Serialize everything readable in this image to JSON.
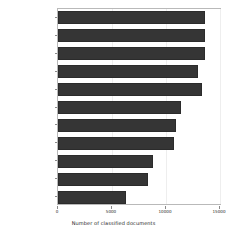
{
  "chart_data": {
    "type": "bar",
    "orientation": "horizontal",
    "title": "",
    "xlabel": "Number of classified documents",
    "ylabel": "",
    "categories": [
      "general words",
      "syringe",
      "marijuana",
      "preparation slang",
      "injections",
      "cocaine",
      "sex serum",
      "pills",
      "methamphetamine",
      "needle",
      "heroin"
    ],
    "values": [
      13600,
      13600,
      13600,
      12950,
      13300,
      11400,
      10900,
      10700,
      8800,
      8300,
      6300
    ],
    "xlim": [
      0,
      15000
    ],
    "xticks": [
      0,
      5000,
      10000,
      15000
    ],
    "xtick_labels": [
      "0",
      "5000",
      "10000",
      "15000"
    ],
    "grid": true,
    "legend": null,
    "bar_color": "#353535",
    "bar_edge_color": "#2b2b2b",
    "axes_color": "#b9b9b9",
    "grid_color": "#eeeeee",
    "text_color": "#2a2a2a",
    "background": "#ffffff"
  }
}
